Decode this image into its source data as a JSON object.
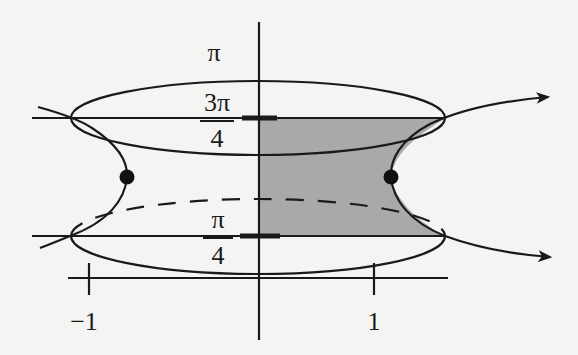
{
  "diagram": {
    "type": "math-figure",
    "colors": {
      "background": "#f4f4f2",
      "stroke": "#1a1a1a",
      "shade": "#a9a9a9"
    },
    "labels": {
      "pi": "π",
      "three_pi_over_4": {
        "numerator": "3π",
        "denominator": "4"
      },
      "pi_over_4": {
        "numerator": "π",
        "denominator": "4"
      },
      "tick_neg1": "−1",
      "tick_1": "1"
    },
    "levels": [
      {
        "name": "3π/4",
        "y": 118
      },
      {
        "name": "π/4",
        "y": 236
      }
    ],
    "points": [
      {
        "name": "left-dot",
        "x": 127,
        "y": 177
      },
      {
        "name": "right-dot",
        "x": 391,
        "y": 177
      }
    ],
    "arrows": [
      {
        "name": "upper-arrow",
        "direction": "right-up"
      },
      {
        "name": "lower-arrow",
        "direction": "right-down"
      }
    ]
  }
}
